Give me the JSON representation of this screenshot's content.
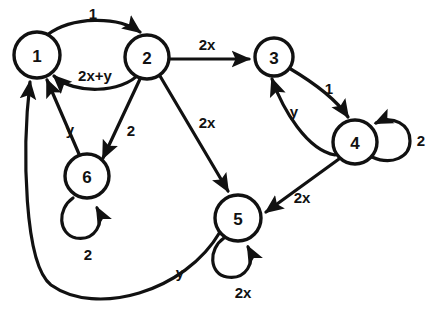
{
  "diagram": {
    "kind": "state-transition-graph",
    "background_color": "#ffffff",
    "stroke_color": "#111111",
    "nodes": [
      {
        "id": "1",
        "label": "1",
        "cx": 37,
        "cy": 55,
        "r": 23
      },
      {
        "id": "2",
        "label": "2",
        "cx": 147,
        "cy": 57,
        "r": 22
      },
      {
        "id": "3",
        "label": "3",
        "cx": 274,
        "cy": 57,
        "r": 19
      },
      {
        "id": "4",
        "label": "4",
        "cx": 355,
        "cy": 142,
        "r": 22
      },
      {
        "id": "5",
        "label": "5",
        "cx": 238,
        "cy": 218,
        "r": 23
      },
      {
        "id": "6",
        "label": "6",
        "cx": 87,
        "cy": 176,
        "r": 22
      }
    ],
    "edges": [
      {
        "from": "1",
        "to": "2",
        "label": "1",
        "label_x": 93,
        "label_y": 13,
        "shape": "arc-above"
      },
      {
        "from": "2",
        "to": "1",
        "label": "2x+y",
        "label_x": 95,
        "label_y": 75,
        "shape": "arc-below"
      },
      {
        "from": "2",
        "to": "3",
        "label": "2x",
        "label_x": 207,
        "label_y": 44,
        "shape": "straight"
      },
      {
        "from": "3",
        "to": "4",
        "label": "1",
        "label_x": 329,
        "label_y": 88,
        "shape": "arc-right"
      },
      {
        "from": "4",
        "to": "3",
        "label": "y",
        "label_x": 294,
        "label_y": 111,
        "shape": "arc-left"
      },
      {
        "from": "4",
        "to": "5",
        "label": "2x",
        "label_x": 302,
        "label_y": 197,
        "shape": "straight"
      },
      {
        "from": "2",
        "to": "5",
        "label": "2x",
        "label_x": 207,
        "label_y": 122,
        "shape": "straight"
      },
      {
        "from": "2",
        "to": "6",
        "label": "2",
        "label_x": 131,
        "label_y": 130,
        "shape": "straight"
      },
      {
        "from": "6",
        "to": "1",
        "label": "y",
        "label_x": 70,
        "label_y": 129,
        "shape": "straight"
      },
      {
        "from": "5",
        "to": "1",
        "label": "y",
        "label_x": 180,
        "label_y": 272,
        "shape": "long-arc-bottom"
      }
    ],
    "self_loops": [
      {
        "node": "4",
        "label": "2",
        "label_x": 421,
        "label_y": 140,
        "side": "right"
      },
      {
        "node": "5",
        "label": "2x",
        "label_x": 243,
        "label_y": 292,
        "side": "below"
      },
      {
        "node": "6",
        "label": "2",
        "label_x": 88,
        "label_y": 254,
        "side": "below"
      }
    ]
  }
}
